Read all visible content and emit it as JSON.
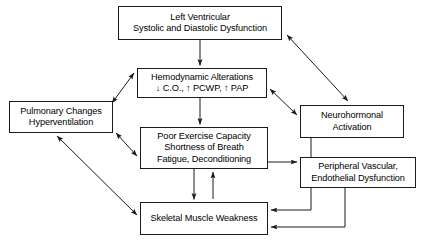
{
  "figure": {
    "type": "flowchart",
    "background_color": "#ffffff",
    "line_color": "#1a1a1a",
    "text_color": "#000000"
  },
  "nodes": {
    "lv": {
      "id": "left-ventricular-dysfunction",
      "lines": [
        "Left Ventricular",
        "Systolic and Diastolic Dysfunction"
      ]
    },
    "hemodynamic": {
      "id": "hemodynamic-alterations",
      "lines": [
        "Hemodynamic Alterations",
        "↓ C.O., ↑ PCWP, ↑ PAP"
      ]
    },
    "pulmonary": {
      "id": "pulmonary-changes",
      "lines": [
        "Pulmonary Changes",
        "Hyperventilation"
      ]
    },
    "neurohormonal": {
      "id": "neurohormonal-activation",
      "lines": [
        "Neurohormonal",
        "Activation"
      ]
    },
    "exercise": {
      "id": "poor-exercise-capacity",
      "lines": [
        "Poor Exercise Capacity",
        "Shortness of Breath",
        "Fatigue, Deconditioning"
      ]
    },
    "peripheral": {
      "id": "peripheral-vascular-dysfunction",
      "lines": [
        "Peripheral Vascular,",
        "Endothelial Dysfunction"
      ]
    },
    "skeletal": {
      "id": "skeletal-muscle-weakness",
      "lines": [
        "Skeletal Muscle Weakness"
      ]
    }
  },
  "edges": [
    {
      "from": "lv",
      "to": "hemodynamic",
      "style": "straight-vertical",
      "direction": "one-way"
    },
    {
      "from": "lv",
      "to": "neurohormonal",
      "style": "diagonal",
      "direction": "two-way"
    },
    {
      "from": "hemodynamic",
      "to": "exercise",
      "style": "straight-vertical",
      "direction": "one-way"
    },
    {
      "from": "hemodynamic",
      "to": "pulmonary",
      "style": "diagonal",
      "direction": "two-way"
    },
    {
      "from": "hemodynamic",
      "to": "neurohormonal",
      "style": "diagonal",
      "direction": "two-way"
    },
    {
      "from": "pulmonary",
      "to": "exercise",
      "style": "diagonal",
      "direction": "two-way"
    },
    {
      "from": "pulmonary",
      "to": "skeletal",
      "style": "diagonal",
      "direction": "two-way"
    },
    {
      "from": "exercise",
      "to": "skeletal",
      "style": "straight-vertical",
      "direction": "one-way"
    },
    {
      "from": "skeletal",
      "to": "exercise",
      "style": "straight-vertical",
      "direction": "one-way"
    },
    {
      "from": "exercise",
      "to": "peripheral",
      "style": "orthogonal",
      "direction": "one-way"
    },
    {
      "from": "neurohormonal",
      "to": "skeletal",
      "style": "orthogonal",
      "direction": "one-way"
    },
    {
      "from": "peripheral",
      "to": "skeletal",
      "style": "orthogonal",
      "direction": "one-way"
    }
  ]
}
